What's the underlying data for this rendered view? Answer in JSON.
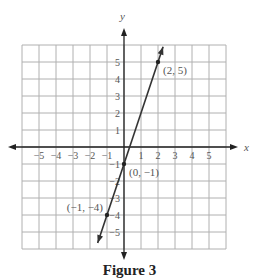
{
  "chart_data": {
    "type": "line",
    "title": "Figure 3",
    "xlabel": "x",
    "ylabel": "y",
    "xlim": [
      -6,
      6
    ],
    "ylim": [
      -6,
      6
    ],
    "grid": true,
    "x_ticks": [
      -5,
      -4,
      -3,
      -2,
      -1,
      1,
      2,
      3,
      4,
      5
    ],
    "y_ticks": [
      5,
      4,
      3,
      2,
      1,
      -1,
      -2,
      -3,
      -4,
      -5
    ],
    "x_tick_labels": [
      "−5",
      "−4",
      "−3",
      "−2",
      "−1",
      "1",
      "2",
      "3",
      "4",
      "5"
    ],
    "y_tick_labels": [
      "5",
      "4",
      "3",
      "2",
      "1",
      "−1",
      "−2",
      "−3",
      "−4",
      "−5"
    ],
    "series": [
      {
        "name": "y = 3x − 1",
        "slope": 3,
        "intercept": -1,
        "x_range": [
          -1.55,
          2.3
        ],
        "points": [
          {
            "x": 2,
            "y": 5,
            "label": "(2, 5)"
          },
          {
            "x": 0,
            "y": -1,
            "label": "(0, −1)"
          },
          {
            "x": -1,
            "y": -4,
            "label": "(−1, −4)"
          }
        ]
      }
    ]
  },
  "caption": "Figure 3",
  "colors": {
    "grid": "#b0b0b0",
    "axis": "#222222",
    "line": "#333333",
    "text": "#555555"
  }
}
